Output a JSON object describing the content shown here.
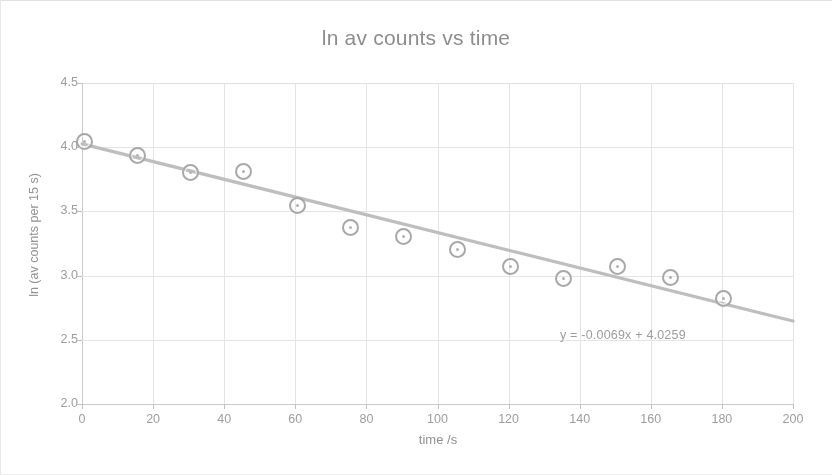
{
  "chart_data": {
    "type": "scatter",
    "title": "ln av counts vs time",
    "xlabel": "time /s",
    "ylabel": "ln (av counts per 15 s)",
    "xlim": [
      0,
      200
    ],
    "ylim": [
      2.0,
      4.5
    ],
    "xticks": [
      0,
      20,
      40,
      60,
      80,
      100,
      120,
      140,
      160,
      180,
      200
    ],
    "yticks": [
      "2.0",
      "2.5",
      "3.0",
      "3.5",
      "4.0",
      "4.5"
    ],
    "grid": true,
    "legend": "none",
    "x": [
      0,
      15,
      30,
      45,
      60,
      75,
      90,
      105,
      120,
      135,
      150,
      165,
      180
    ],
    "values": [
      4.06,
      3.95,
      3.82,
      3.83,
      3.56,
      3.39,
      3.32,
      3.22,
      3.09,
      2.99,
      3.09,
      3.0,
      2.84
    ],
    "series": [
      {
        "name": "ln av counts",
        "marker": "open-circle",
        "color": "#a6a6a6",
        "x": [
          0,
          15,
          30,
          45,
          60,
          75,
          90,
          105,
          120,
          135,
          150,
          165,
          180
        ],
        "values": [
          4.06,
          3.95,
          3.82,
          3.83,
          3.56,
          3.39,
          3.32,
          3.22,
          3.09,
          2.99,
          3.09,
          3.0,
          2.84
        ]
      }
    ],
    "trendline": {
      "type": "linear",
      "equation": "y = -0.0069x + 4.0259",
      "slope": -0.0069,
      "intercept": 4.0259,
      "x_start": 0,
      "x_end": 200,
      "color": "#bdbdbd"
    },
    "annotations": [
      {
        "text": "y = -0.0069x + 4.0259",
        "x": 118,
        "y": 2.63
      }
    ]
  },
  "style": {
    "grid_color": "#e4e4e4",
    "axis_color": "#c9c9c9",
    "text_color": "#9b9b9b",
    "title_color": "#8a8a8a",
    "marker_color": "#a6a6a6",
    "trend_color": "#bdbdbd",
    "background": "#ffffff"
  }
}
